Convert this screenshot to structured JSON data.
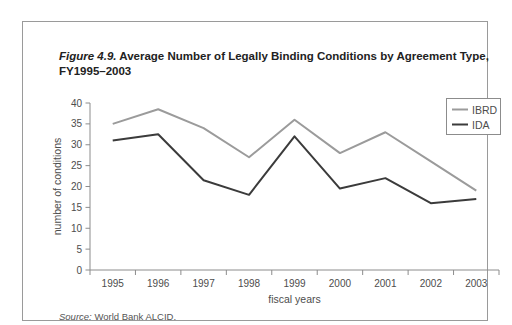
{
  "figure": {
    "title_prefix": "Figure 4.9.",
    "title_rest": " Average Number of Legally Binding Conditions by Agreement Type,",
    "title_line2": "FY1995–2003",
    "source_label": "Source:",
    "source_text": " World Bank ALCID."
  },
  "chart_data": {
    "type": "line",
    "categories": [
      "1995",
      "1996",
      "1997",
      "1998",
      "1999",
      "2000",
      "2001",
      "2002",
      "2003"
    ],
    "series": [
      {
        "name": "IBRD",
        "color": "#9b9b9b",
        "values": [
          35,
          38.5,
          34,
          27,
          36,
          28,
          33,
          26,
          19
        ]
      },
      {
        "name": "IDA",
        "color": "#3b3b3b",
        "values": [
          31,
          32.5,
          21.5,
          18,
          32,
          19.5,
          22,
          16,
          17
        ]
      }
    ],
    "xlabel": "fiscal years",
    "ylabel": "number of conditions",
    "ylim": [
      0,
      40
    ],
    "ytick_step": 5,
    "yticks": [
      0,
      5,
      10,
      15,
      20,
      25,
      30,
      35,
      40
    ],
    "grid": false,
    "legend_position": "top-right"
  },
  "colors": {
    "axis": "#8c8c8c",
    "tick_text": "#4d4d4d",
    "border": "#9a9a9a",
    "background": "#ffffff",
    "title_text": "#222222",
    "source_text": "#555555"
  }
}
